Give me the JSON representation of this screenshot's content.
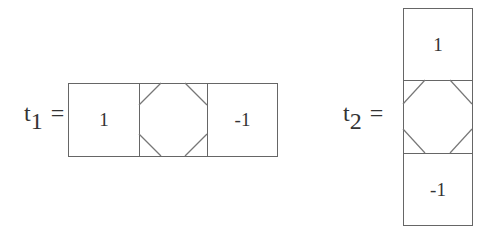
{
  "diagram": {
    "t1": {
      "label_base": "t",
      "label_sub": "1",
      "equals": "=",
      "orientation": "horizontal",
      "cells": [
        "1",
        "",
        "-1"
      ]
    },
    "t2": {
      "label_base": "t",
      "label_sub": "2",
      "equals": "=",
      "orientation": "vertical",
      "cells": [
        "1",
        "",
        "-1"
      ]
    }
  }
}
